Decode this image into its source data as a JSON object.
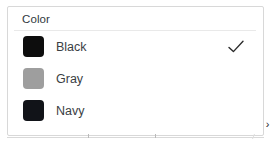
{
  "panel": {
    "title": "Color",
    "border_color": "#d8d8d8",
    "divider_color": "#e9e9e9",
    "background": "#ffffff"
  },
  "options": [
    {
      "label": "Black",
      "swatch_color": "#0d0d0d",
      "selected": true,
      "check_glyph": "check-icon"
    },
    {
      "label": "Gray",
      "swatch_color": "#9e9e9e",
      "selected": false,
      "check_glyph": ""
    },
    {
      "label": "Navy",
      "swatch_color": "#111318",
      "selected": false,
      "check_glyph": ""
    }
  ],
  "scroll": {
    "chevron": "›"
  },
  "axis": {
    "line_color": "#d9d9d9",
    "tick_color": "#b9b9b9"
  }
}
